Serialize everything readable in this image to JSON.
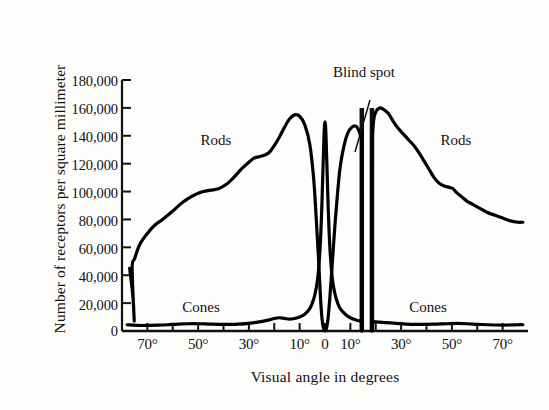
{
  "chart_data": {
    "type": "line",
    "title": "",
    "xlabel": "Visual angle in degrees",
    "ylabel": "Number of receptors per square millimeter",
    "xlim": [
      -80,
      80
    ],
    "ylim": [
      0,
      180000
    ],
    "grid": false,
    "legend": "inline-labels",
    "y_ticks": [
      {
        "value": 180000,
        "label": "180,000"
      },
      {
        "value": 160000,
        "label": "160,000"
      },
      {
        "value": 140000,
        "label": "140,000"
      },
      {
        "value": 120000,
        "label": "120,000"
      },
      {
        "value": 100000,
        "label": "100,000"
      },
      {
        "value": 80000,
        "label": "80,000"
      },
      {
        "value": 60000,
        "label": "60,000"
      },
      {
        "value": 40000,
        "label": "40,000"
      },
      {
        "value": 20000,
        "label": "20,000"
      },
      {
        "value": 0,
        "label": "0"
      }
    ],
    "x_ticks": [
      {
        "value": -70,
        "label": "70°",
        "major": true
      },
      {
        "value": -60,
        "label": "",
        "major": false
      },
      {
        "value": -50,
        "label": "50°",
        "major": true
      },
      {
        "value": -40,
        "label": "",
        "major": false
      },
      {
        "value": -30,
        "label": "30°",
        "major": true
      },
      {
        "value": -20,
        "label": "",
        "major": false
      },
      {
        "value": -10,
        "label": "10°",
        "major": true
      },
      {
        "value": 0,
        "label": "0",
        "major": true
      },
      {
        "value": 10,
        "label": "10°",
        "major": true
      },
      {
        "value": 20,
        "label": "",
        "major": false
      },
      {
        "value": 30,
        "label": "30°",
        "major": true
      },
      {
        "value": 40,
        "label": "",
        "major": false
      },
      {
        "value": 50,
        "label": "50°",
        "major": true
      },
      {
        "value": 60,
        "label": "",
        "major": false
      },
      {
        "value": 70,
        "label": "70°",
        "major": true
      }
    ],
    "annotations": [
      {
        "name": "blind-spot",
        "text": "Blind spot",
        "x": 20,
        "y": 176000
      },
      {
        "name": "rods-left",
        "text": "Rods",
        "x": -33,
        "y": 142000
      },
      {
        "name": "rods-right",
        "text": "Rods",
        "x": 47,
        "y": 142000
      },
      {
        "name": "cones-left",
        "text": "Cones",
        "x": -45,
        "y": 16000
      },
      {
        "name": "cones-right",
        "text": "Cones",
        "x": 40,
        "y": 16000
      }
    ],
    "blind_spot_region": {
      "x_start": 14.5,
      "x_end": 18.5,
      "top_value": 160000
    },
    "series": [
      {
        "name": "Rods",
        "color": "#000000",
        "points": [
          [
            -77,
            45000
          ],
          [
            -76,
            30000
          ],
          [
            -75.5,
            20000
          ],
          [
            -75.2,
            8000
          ],
          [
            -76,
            45000
          ],
          [
            -75,
            52000
          ],
          [
            -73,
            62000
          ],
          [
            -70,
            70000
          ],
          [
            -67,
            76000
          ],
          [
            -64,
            80000
          ],
          [
            -60,
            86000
          ],
          [
            -57,
            91000
          ],
          [
            -54,
            95000
          ],
          [
            -51,
            98000
          ],
          [
            -48,
            100000
          ],
          [
            -45,
            101000
          ],
          [
            -42,
            102000
          ],
          [
            -39,
            105000
          ],
          [
            -36,
            110000
          ],
          [
            -33,
            116000
          ],
          [
            -30,
            121000
          ],
          [
            -28,
            124000
          ],
          [
            -26,
            125000
          ],
          [
            -24,
            126000
          ],
          [
            -22,
            128000
          ],
          [
            -20,
            133000
          ],
          [
            -18,
            139000
          ],
          [
            -16,
            146000
          ],
          [
            -14,
            152000
          ],
          [
            -12,
            155000
          ],
          [
            -10,
            154000
          ],
          [
            -8,
            148000
          ],
          [
            -6,
            134000
          ],
          [
            -4.5,
            110000
          ],
          [
            -3.5,
            82000
          ],
          [
            -2.5,
            50000
          ],
          [
            -1.8,
            25000
          ],
          [
            -1.2,
            9000
          ],
          [
            -0.6,
            2000
          ],
          [
            0,
            0
          ],
          [
            0.6,
            2000
          ],
          [
            1.2,
            9000
          ],
          [
            2,
            26000
          ],
          [
            3,
            52000
          ],
          [
            4,
            78000
          ],
          [
            5,
            100000
          ],
          [
            6,
            118000
          ],
          [
            7.5,
            133000
          ],
          [
            9,
            142000
          ],
          [
            10.5,
            146000
          ],
          [
            12,
            147000
          ],
          [
            13,
            145000
          ],
          [
            14,
            140000
          ],
          [
            14.5,
            132000
          ],
          [
            14.5,
            0
          ]
        ],
        "segment2": [
          [
            18.5,
            0
          ],
          [
            18.5,
            120000
          ],
          [
            19,
            148000
          ],
          [
            20,
            157000
          ],
          [
            21.5,
            160000
          ],
          [
            23,
            159000
          ],
          [
            25,
            156000
          ],
          [
            27,
            150000
          ],
          [
            29,
            145000
          ],
          [
            31,
            141000
          ],
          [
            33,
            137000
          ],
          [
            35,
            133000
          ],
          [
            37,
            128000
          ],
          [
            39,
            122000
          ],
          [
            41,
            116000
          ],
          [
            43,
            110000
          ],
          [
            45,
            106000
          ],
          [
            47,
            104000
          ],
          [
            49,
            103000
          ],
          [
            50.5,
            102000
          ],
          [
            52,
            99000
          ],
          [
            54,
            96000
          ],
          [
            56,
            93000
          ],
          [
            58,
            91000
          ],
          [
            61,
            88000
          ],
          [
            64,
            85000
          ],
          [
            67,
            83000
          ],
          [
            70,
            81000
          ],
          [
            73,
            79000
          ],
          [
            76,
            78000
          ],
          [
            78,
            78000
          ]
        ]
      },
      {
        "name": "Cones",
        "color": "#000000",
        "points": [
          [
            -78,
            4500
          ],
          [
            -74,
            4000
          ],
          [
            -70,
            4000
          ],
          [
            -66,
            4200
          ],
          [
            -62,
            4500
          ],
          [
            -58,
            5000
          ],
          [
            -54,
            5200
          ],
          [
            -50,
            5200
          ],
          [
            -46,
            5000
          ],
          [
            -42,
            4800
          ],
          [
            -38,
            4800
          ],
          [
            -34,
            5000
          ],
          [
            -30,
            5500
          ],
          [
            -26,
            6500
          ],
          [
            -22,
            8000
          ],
          [
            -20,
            9000
          ],
          [
            -18,
            9500
          ],
          [
            -16,
            9000
          ],
          [
            -14,
            8500
          ],
          [
            -12,
            9000
          ],
          [
            -10,
            10000
          ],
          [
            -8,
            12000
          ],
          [
            -6,
            16000
          ],
          [
            -5,
            20000
          ],
          [
            -4,
            26000
          ],
          [
            -3,
            36000
          ],
          [
            -2.2,
            52000
          ],
          [
            -1.6,
            72000
          ],
          [
            -1.1,
            98000
          ],
          [
            -0.7,
            122000
          ],
          [
            -0.35,
            142000
          ],
          [
            0,
            150000
          ],
          [
            0.35,
            142000
          ],
          [
            0.7,
            122000
          ],
          [
            1.1,
            98000
          ],
          [
            1.6,
            72000
          ],
          [
            2.2,
            52000
          ],
          [
            3,
            36000
          ],
          [
            4,
            26000
          ],
          [
            5,
            20000
          ],
          [
            6,
            16000
          ],
          [
            8,
            12000
          ],
          [
            10,
            9500
          ],
          [
            12,
            8000
          ],
          [
            14,
            7000
          ],
          [
            14.5,
            6500
          ],
          [
            14.5,
            0
          ]
        ],
        "segment2": [
          [
            18.5,
            0
          ],
          [
            18.5,
            6000
          ],
          [
            20,
            6500
          ],
          [
            24,
            6000
          ],
          [
            28,
            5500
          ],
          [
            32,
            5000
          ],
          [
            36,
            4800
          ],
          [
            40,
            4800
          ],
          [
            44,
            5000
          ],
          [
            48,
            5200
          ],
          [
            52,
            5400
          ],
          [
            56,
            5200
          ],
          [
            60,
            4800
          ],
          [
            64,
            4500
          ],
          [
            68,
            4300
          ],
          [
            72,
            4300
          ],
          [
            76,
            4500
          ],
          [
            78,
            4500
          ]
        ]
      }
    ]
  }
}
